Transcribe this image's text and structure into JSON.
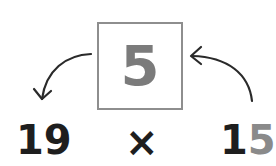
{
  "diagram": {
    "box_value": "5",
    "left_number": "19",
    "operator": "×",
    "right_number_tens": "1",
    "right_number_ones": "5",
    "colors": {
      "box_border": "#8e8e8e",
      "box_digit": "#7b7b7b",
      "highlight_digit": "#8a8a8a",
      "text": "#1e1e1e",
      "arrow": "#2a2a2a"
    },
    "arrows": [
      {
        "name": "from-box-to-left-number",
        "direction": "left-down"
      },
      {
        "name": "from-right-number-to-box",
        "direction": "up-left"
      }
    ]
  }
}
